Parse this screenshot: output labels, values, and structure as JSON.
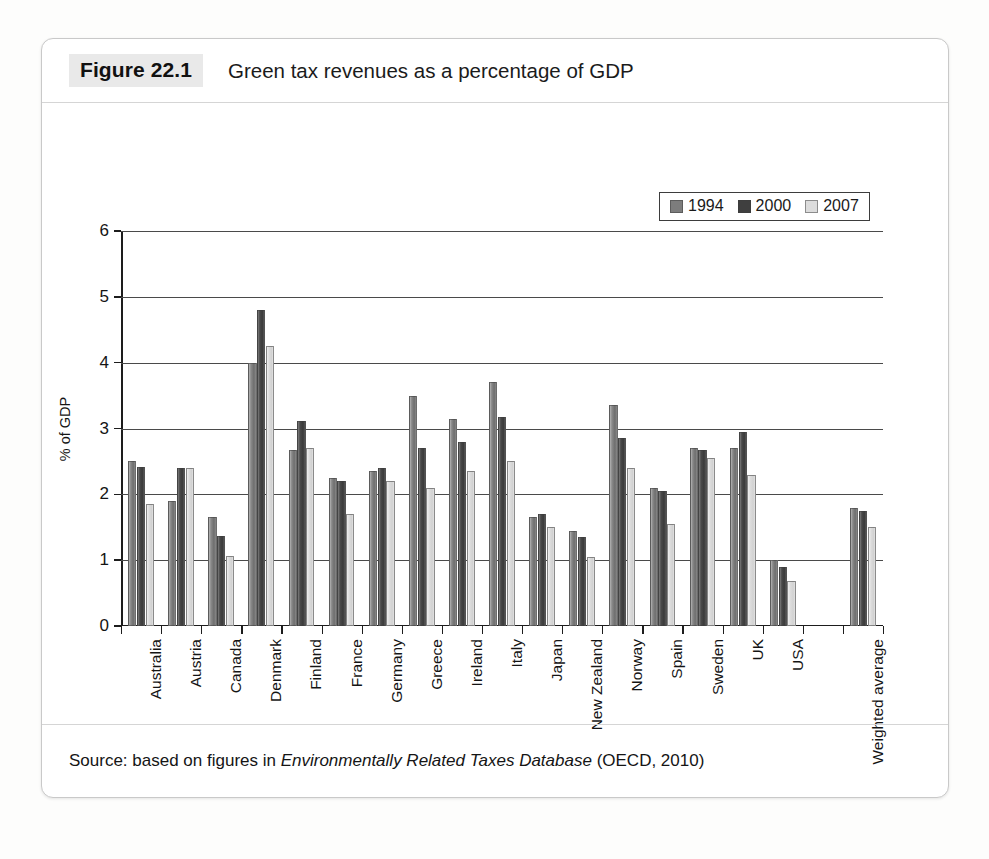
{
  "figure": {
    "tag": "Figure 22.1",
    "title": "Green tax revenues as a percentage of GDP",
    "source_prefix": "Source: based on figures in ",
    "source_italic": "Environmentally Related Taxes Database",
    "source_suffix": " (OECD, 2010)"
  },
  "legend": {
    "position": "top-right-inside",
    "items": [
      {
        "label": "1994",
        "color": "#7d7d7d"
      },
      {
        "label": "2000",
        "color": "#3f3f3f"
      },
      {
        "label": "2007",
        "color": "#dcdcdc"
      }
    ]
  },
  "axes": {
    "y_title": "% of GDP",
    "y_ticks": [
      "0",
      "1",
      "2",
      "3",
      "4",
      "5",
      "6"
    ]
  },
  "chart_data": {
    "type": "bar",
    "title": "Green tax revenues as a percentage of GDP",
    "xlabel": "",
    "ylabel": "% of GDP",
    "ylim": [
      0,
      6
    ],
    "ytick_step": 1,
    "grid": true,
    "legend_position": "upper right",
    "categories": [
      "Australia",
      "Austria",
      "Canada",
      "Denmark",
      "Finland",
      "France",
      "Germany",
      "Greece",
      "Ireland",
      "Italy",
      "Japan",
      "New Zealand",
      "Norway",
      "Spain",
      "Sweden",
      "UK",
      "USA",
      "",
      "Weighted average"
    ],
    "series": [
      {
        "name": "1994",
        "color": "#7d7d7d",
        "values": [
          2.5,
          1.9,
          1.65,
          4.0,
          2.68,
          2.25,
          2.35,
          3.5,
          3.15,
          3.7,
          1.65,
          1.45,
          3.35,
          2.1,
          2.7,
          2.7,
          1.0,
          null,
          1.8
        ]
      },
      {
        "name": "2000",
        "color": "#3f3f3f",
        "values": [
          2.42,
          2.4,
          1.37,
          4.8,
          3.12,
          2.2,
          2.4,
          2.7,
          2.8,
          3.18,
          1.7,
          1.35,
          2.85,
          2.05,
          2.68,
          2.95,
          0.9,
          null,
          1.75
        ]
      },
      {
        "name": "2007",
        "color": "#dcdcdc",
        "values": [
          1.85,
          2.4,
          1.07,
          4.25,
          2.7,
          1.7,
          2.2,
          2.1,
          2.35,
          2.5,
          1.5,
          1.05,
          2.4,
          1.55,
          2.55,
          2.3,
          0.68,
          null,
          1.5
        ]
      }
    ]
  }
}
